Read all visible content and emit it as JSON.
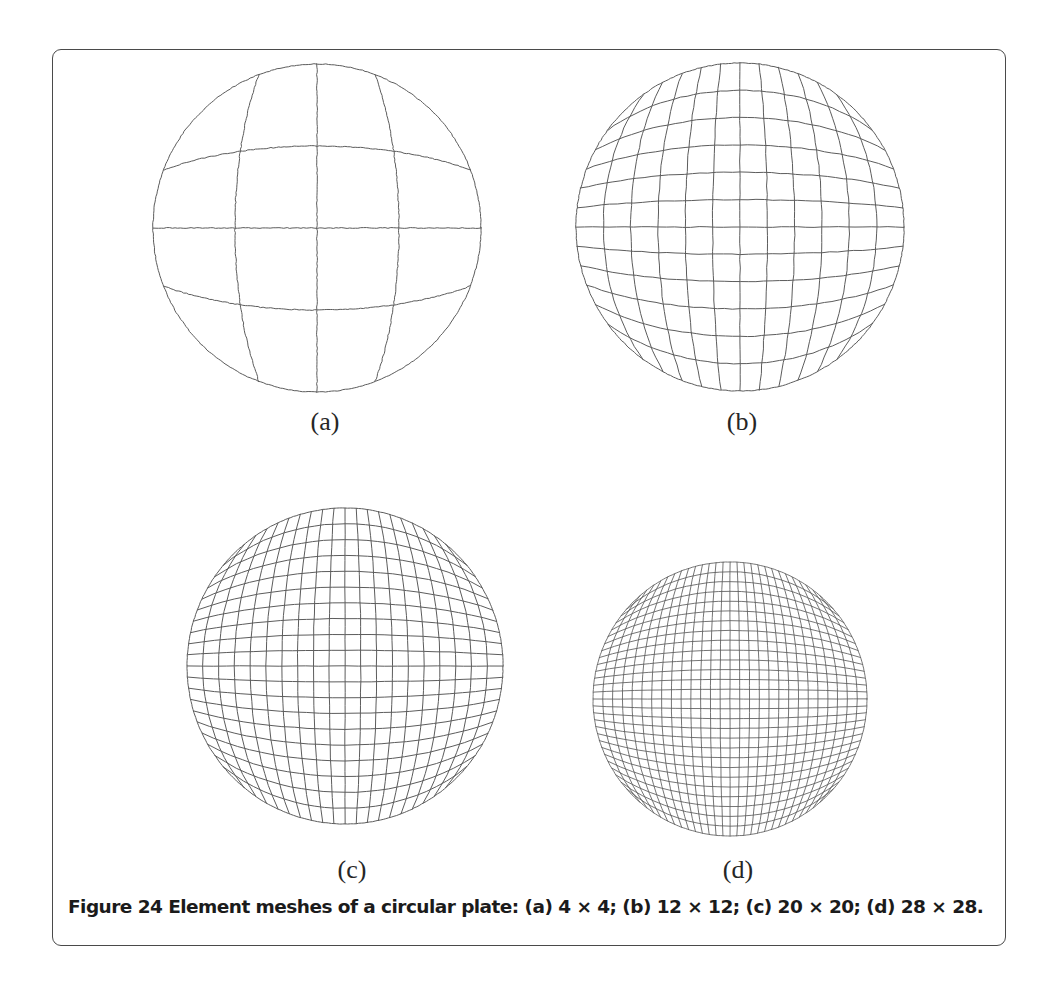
{
  "figure": {
    "number": "Figure 24",
    "caption": "Figure 24 Element meshes of a circular plate: (a) 4 × 4; (b) 12 × 12; (c) 20 × 20; (d) 28 × 28.",
    "subject": "Element meshes of a circular plate",
    "frame": {
      "border_color": "#4a4a4a",
      "background": "#ffffff",
      "corner_radius": 9
    },
    "mesh_line_color": "#5c5c5c",
    "page_background": "#ffffff"
  },
  "panels": [
    {
      "key": "a",
      "label": "(a)",
      "divisions": 4,
      "mesh_text": "4 × 4",
      "center_x": 317,
      "center_y": 228,
      "radius": 164,
      "stroke_width": 1.0
    },
    {
      "key": "b",
      "label": "(b)",
      "divisions": 12,
      "mesh_text": "12 × 12",
      "center_x": 740,
      "center_y": 227,
      "radius": 164,
      "stroke_width": 1.0
    },
    {
      "key": "c",
      "label": "(c)",
      "divisions": 20,
      "mesh_text": "20 × 20",
      "center_x": 345,
      "center_y": 666,
      "radius": 158,
      "stroke_width": 1.0
    },
    {
      "key": "d",
      "label": "(d)",
      "divisions": 28,
      "mesh_text": "28 × 28",
      "center_x": 730,
      "center_y": 699,
      "radius": 137,
      "stroke_width": 0.85
    }
  ],
  "chart_data": {
    "type": "diagram",
    "title": "Element meshes of a circular plate",
    "categories": [
      "(a)",
      "(b)",
      "(c)",
      "(d)"
    ],
    "values": [
      4,
      12,
      20,
      28
    ],
    "series": [
      {
        "name": "Mesh divisions per side",
        "values": [
          4,
          12,
          20,
          28
        ]
      },
      {
        "name": "Total elements",
        "values": [
          16,
          144,
          400,
          784
        ]
      }
    ],
    "xlabel": "Panel",
    "ylabel": "Mesh divisions",
    "legend": [],
    "grid": false
  }
}
